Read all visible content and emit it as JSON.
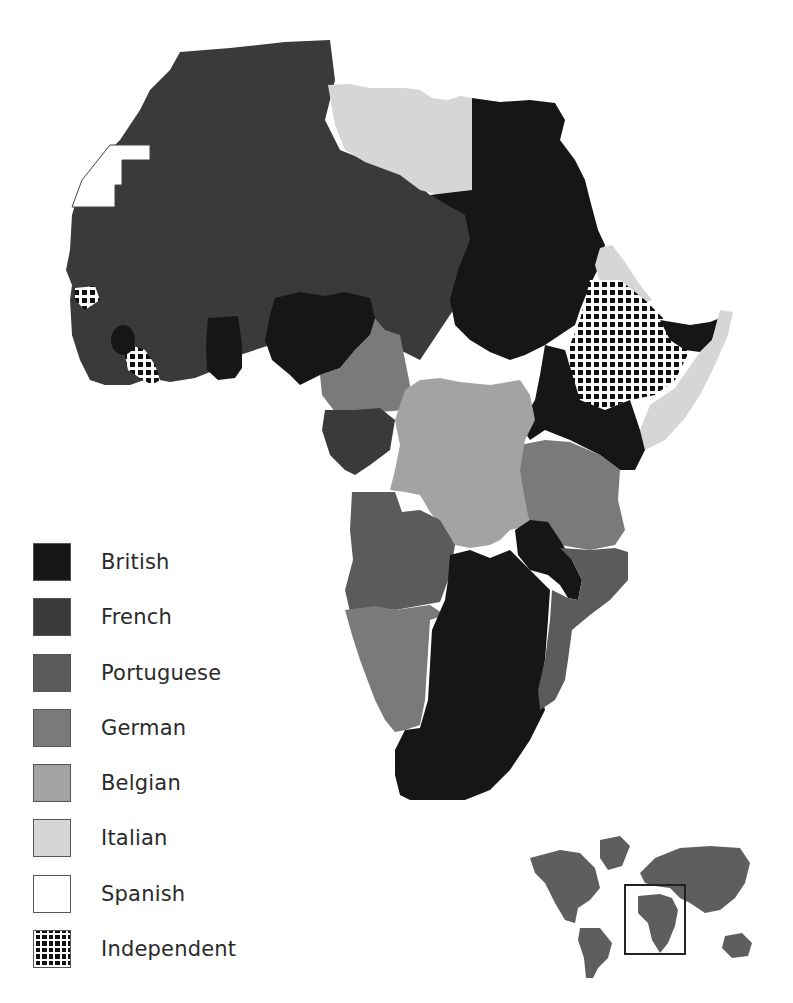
{
  "legend": {
    "items": [
      {
        "key": "british",
        "label": "British",
        "color": "#161616"
      },
      {
        "key": "french",
        "label": "French",
        "color": "#3a3a3a"
      },
      {
        "key": "portuguese",
        "label": "Portuguese",
        "color": "#5b5b5b"
      },
      {
        "key": "german",
        "label": "German",
        "color": "#7a7a7a"
      },
      {
        "key": "belgian",
        "label": "Belgian",
        "color": "#a3a3a3"
      },
      {
        "key": "italian",
        "label": "Italian",
        "color": "#d6d6d6"
      },
      {
        "key": "spanish",
        "label": "Spanish",
        "color": "#ffffff"
      },
      {
        "key": "independent",
        "label": "Independent",
        "pattern": "grid"
      }
    ]
  },
  "map": {
    "regions": [
      {
        "name": "French North & West Africa",
        "holder": "french"
      },
      {
        "name": "Spanish Sahara",
        "holder": "spanish"
      },
      {
        "name": "Italian Libya",
        "holder": "italian"
      },
      {
        "name": "British Egypt & Sudan",
        "holder": "british"
      },
      {
        "name": "Italian Eritrea",
        "holder": "italian"
      },
      {
        "name": "Ethiopia",
        "holder": "independent"
      },
      {
        "name": "British Somaliland",
        "holder": "british"
      },
      {
        "name": "Italian Somaliland",
        "holder": "italian"
      },
      {
        "name": "Liberia",
        "holder": "independent"
      },
      {
        "name": "Sierra Leone",
        "holder": "british"
      },
      {
        "name": "Gold Coast",
        "holder": "british"
      },
      {
        "name": "Nigeria",
        "holder": "british"
      },
      {
        "name": "Kamerun",
        "holder": "german"
      },
      {
        "name": "French Equatorial Africa",
        "holder": "french"
      },
      {
        "name": "Belgian Congo",
        "holder": "belgian"
      },
      {
        "name": "British East Africa",
        "holder": "british"
      },
      {
        "name": "German East Africa",
        "holder": "german"
      },
      {
        "name": "Angola",
        "holder": "portuguese"
      },
      {
        "name": "German South West Africa",
        "holder": "german"
      },
      {
        "name": "Mozambique",
        "holder": "portuguese"
      },
      {
        "name": "British Southern Africa",
        "holder": "british"
      },
      {
        "name": "Nyasaland",
        "holder": "british"
      }
    ]
  },
  "inset": {
    "label": "World locator map",
    "highlight": "Africa"
  }
}
